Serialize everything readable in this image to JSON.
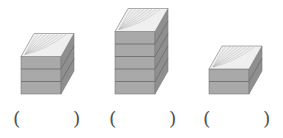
{
  "figure": {
    "stacks": [
      {
        "id": 1,
        "layers": 3,
        "answer_label": "(          )"
      },
      {
        "id": 2,
        "layers": 5,
        "answer_label": "(          )"
      },
      {
        "id": 3,
        "layers": 2,
        "answer_label": "(          )"
      }
    ],
    "parentheses": {
      "open": "(",
      "close": ")"
    },
    "colors": {
      "front": "#a9a9a9",
      "side": "#8f8f8f",
      "top": "#efefef",
      "grain": "#b8b8b8",
      "seam": "#6f6f6f",
      "edge": "#7a7a7a"
    }
  }
}
